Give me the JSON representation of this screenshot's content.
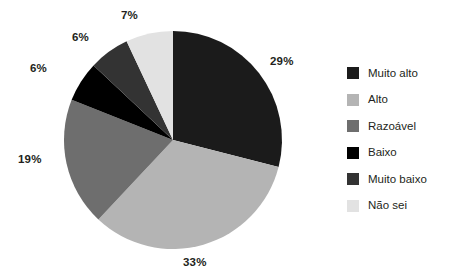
{
  "chart_data": {
    "type": "pie",
    "title": "",
    "categories": [
      "Muito alto",
      "Alto",
      "Razoável",
      "Baixo",
      "Muito baixo",
      "Não sei"
    ],
    "values": [
      29,
      33,
      19,
      6,
      6,
      7
    ],
    "value_labels": [
      "29%",
      "33%",
      "19%",
      "6%",
      "6%",
      "7%"
    ],
    "unit": "%",
    "start_angle_deg": 0,
    "direction": "clockwise",
    "legend_position": "right",
    "grid": false,
    "colors": [
      "#1b1b1b",
      "#b4b4b4",
      "#6e6e6e",
      "#000000",
      "#333333",
      "#e2e2e2"
    ]
  },
  "legend": {
    "items": [
      {
        "label": "Muito alto",
        "color": "#1b1b1b"
      },
      {
        "label": "Alto",
        "color": "#b4b4b4"
      },
      {
        "label": "Razoável",
        "color": "#6e6e6e"
      },
      {
        "label": "Baixo",
        "color": "#000000"
      },
      {
        "label": "Muito baixo",
        "color": "#333333"
      },
      {
        "label": "Não sei",
        "color": "#e2e2e2"
      }
    ]
  },
  "labels": {
    "muito_alto": "29%",
    "alto": "33%",
    "razoavel": "19%",
    "baixo": "6%",
    "muito_baixo": "6%",
    "nao_sei": "7%"
  },
  "geometry": {
    "cx": 173,
    "cy": 140,
    "r": 109
  }
}
